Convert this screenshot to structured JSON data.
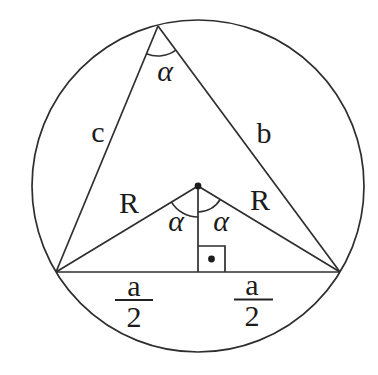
{
  "diagram": {
    "labels": {
      "inscribed_angle": "α",
      "side_c": "c",
      "side_b": "b",
      "radius_left": "R",
      "radius_right": "R",
      "central_angle_left": "α",
      "central_angle_right": "α",
      "half_base_left_numerator": "a",
      "half_base_left_denominator": "2",
      "half_base_right_numerator": "a",
      "half_base_right_denominator": "2"
    },
    "colors": {
      "line_stroke": "#2e2e2e",
      "text": "#1b1b1b",
      "background": "#ffffff"
    }
  }
}
